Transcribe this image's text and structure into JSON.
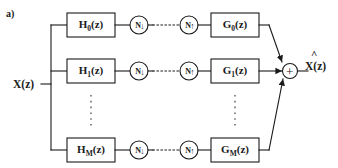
{
  "figure": {
    "panel_label": "a)",
    "input_label": "X(z)",
    "output_label": "X(z)",
    "output_hat": "^",
    "adder_symbol": "+",
    "ink_color": "#1a1a1a",
    "background_color": "#ffffff"
  },
  "branches": [
    {
      "id": "branch-0",
      "analysis_filter": "H",
      "analysis_filter_sub": "0",
      "analysis_filter_tail": "(z)",
      "downsampler": "N",
      "downsampler_arrow": "↓",
      "upsampler": "N",
      "upsampler_arrow": "↑",
      "synthesis_filter": "G",
      "synthesis_filter_sub": "0",
      "synthesis_filter_tail": "(z)"
    },
    {
      "id": "branch-1",
      "analysis_filter": "H",
      "analysis_filter_sub": "1",
      "analysis_filter_tail": "(z)",
      "downsampler": "N",
      "downsampler_arrow": "↓",
      "upsampler": "N",
      "upsampler_arrow": "↑",
      "synthesis_filter": "G",
      "synthesis_filter_sub": "1",
      "synthesis_filter_tail": "(z)"
    },
    {
      "id": "branch-M",
      "analysis_filter": "H",
      "analysis_filter_sub": "M",
      "analysis_filter_tail": "(z)",
      "downsampler": "N",
      "downsampler_arrow": "↓",
      "upsampler": "N",
      "upsampler_arrow": "↑",
      "synthesis_filter": "G",
      "synthesis_filter_sub": "M",
      "synthesis_filter_tail": "(z)"
    }
  ],
  "icons": {
    "downsampler": "down-arrow-icon",
    "upsampler": "up-arrow-icon",
    "adder": "plus-icon",
    "vertical_ellipsis": "vertical-ellipsis-icon",
    "horizontal_ellipsis": "horizontal-ellipsis-icon"
  }
}
